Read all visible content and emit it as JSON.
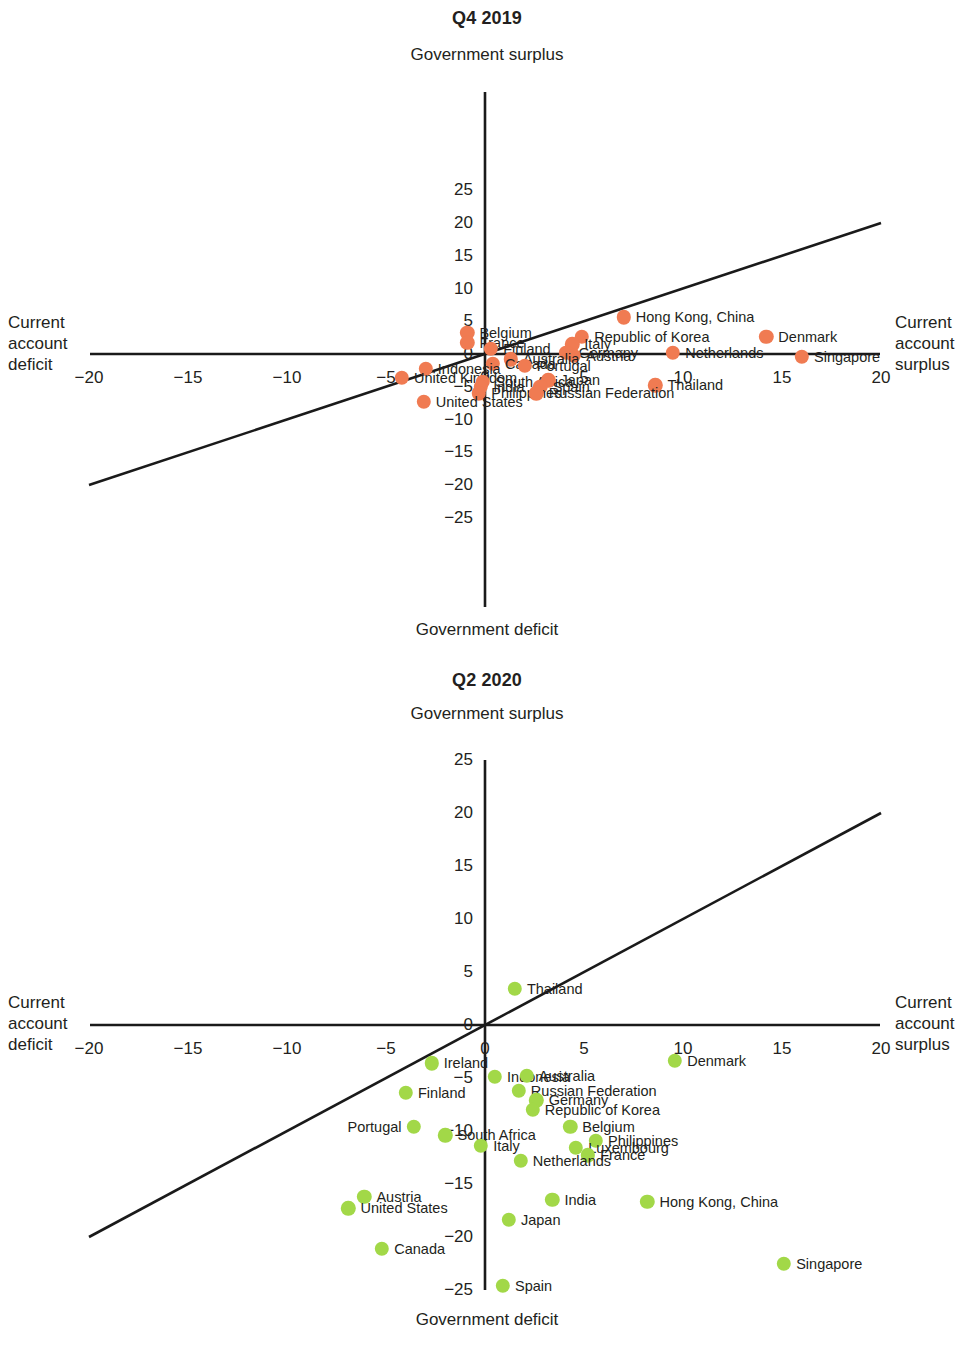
{
  "figure": {
    "axis_caption_top": "Government surplus",
    "axis_caption_bottom": "Government deficit",
    "left_caption_lines": [
      "Current",
      "account",
      "deficit"
    ],
    "right_caption_lines": [
      "Current",
      "account",
      "surplus"
    ],
    "colors": {
      "q4_2019_dot": "#F07B52",
      "q2_2020_dot": "#A2D848",
      "axis": "#1a1a1a",
      "text": "#231f20"
    },
    "x_ticks": [
      "-20",
      "-15",
      "-10",
      "-5",
      "0",
      "5",
      "10",
      "15",
      "20"
    ],
    "x_tick_values": [
      -20,
      -15,
      -10,
      -5,
      0,
      5,
      10,
      15,
      20
    ],
    "y_ticks": [
      "25",
      "20",
      "15",
      "10",
      "5",
      "0",
      "-5",
      "-10",
      "-15",
      "-20",
      "-25"
    ],
    "y_tick_values": [
      25,
      20,
      15,
      10,
      5,
      0,
      -5,
      -10,
      -15,
      -20,
      -25
    ]
  },
  "chart_data": [
    {
      "type": "scatter",
      "title": "Q4 2019",
      "xlabel": "Current account deficit / Current account surplus",
      "ylabel": "Government deficit / Government surplus",
      "xlim": [
        -20,
        20
      ],
      "ylim": [
        -25,
        25
      ],
      "grid": false,
      "legend": "none",
      "annotations": [
        "45-degree reference line y = x"
      ],
      "color": "#F07B52",
      "points": [
        {
          "label": "Hong Kong, China",
          "x": 7.0,
          "y": 5.6,
          "lab": "r"
        },
        {
          "label": "Belgium",
          "x": -0.9,
          "y": 3.2,
          "lab": "r"
        },
        {
          "label": "Republic of Korea",
          "x": 4.9,
          "y": 2.6,
          "lab": "r"
        },
        {
          "label": "Denmark",
          "x": 14.2,
          "y": 2.6,
          "lab": "r"
        },
        {
          "label": "France",
          "x": -0.9,
          "y": 1.7,
          "lab": "r"
        },
        {
          "label": "Italy",
          "x": 4.4,
          "y": 1.5,
          "lab": "r"
        },
        {
          "label": "Finland",
          "x": 0.3,
          "y": 0.8,
          "lab": "r"
        },
        {
          "label": "Germany",
          "x": 4.1,
          "y": 0.2,
          "lab": "r"
        },
        {
          "label": "Netherlands",
          "x": 9.5,
          "y": 0.2,
          "lab": "r"
        },
        {
          "label": "Austria",
          "x": 4.5,
          "y": -0.3,
          "lab": "r"
        },
        {
          "label": "Singapore",
          "x": 16.0,
          "y": -0.4,
          "lab": "r"
        },
        {
          "label": "Australia",
          "x": 1.3,
          "y": -0.8,
          "lab": "r"
        },
        {
          "label": "Canada",
          "x": 0.4,
          "y": -1.5,
          "lab": "r"
        },
        {
          "label": "Portugal",
          "x": 2.0,
          "y": -1.8,
          "lab": "r"
        },
        {
          "label": "Indonesia",
          "x": -3.0,
          "y": -2.3,
          "lab": "r"
        },
        {
          "label": "United Kingdom",
          "x": -4.2,
          "y": -3.6,
          "lab": "r"
        },
        {
          "label": "South Africa",
          "x": -0.1,
          "y": -4.2,
          "lab": "r"
        },
        {
          "label": "Japan",
          "x": 3.2,
          "y": -4.0,
          "lab": "r"
        },
        {
          "label": "India",
          "x": -0.2,
          "y": -5.0,
          "lab": "r"
        },
        {
          "label": "Spain",
          "x": 2.8,
          "y": -5.0,
          "lab": "r"
        },
        {
          "label": "Thailand",
          "x": 8.6,
          "y": -4.8,
          "lab": "r"
        },
        {
          "label": "Philippines",
          "x": -0.3,
          "y": -6.0,
          "lab": "r"
        },
        {
          "label": "Russian Federation",
          "x": 2.6,
          "y": -6.0,
          "lab": "r"
        },
        {
          "label": "United States",
          "x": -3.1,
          "y": -7.3,
          "lab": "r"
        }
      ]
    },
    {
      "type": "scatter",
      "title": "Q2 2020",
      "xlabel": "Current account deficit / Current account surplus",
      "ylabel": "Government deficit / Government surplus",
      "xlim": [
        -20,
        20
      ],
      "ylim": [
        -25,
        25
      ],
      "grid": false,
      "legend": "none",
      "annotations": [
        "45-degree reference line y = x"
      ],
      "color": "#A2D848",
      "points": [
        {
          "label": "Thailand",
          "x": 1.5,
          "y": 3.4,
          "lab": "r"
        },
        {
          "label": "Denmark",
          "x": 9.6,
          "y": -3.4,
          "lab": "r"
        },
        {
          "label": "Ireland",
          "x": -2.7,
          "y": -3.6,
          "lab": "r"
        },
        {
          "label": "Indonesia",
          "x": 0.5,
          "y": -4.9,
          "lab": "r"
        },
        {
          "label": "Australia",
          "x": 2.1,
          "y": -4.8,
          "lab": "r"
        },
        {
          "label": "Russian Federation",
          "x": 1.7,
          "y": -6.2,
          "lab": "r"
        },
        {
          "label": "Finland",
          "x": -4.0,
          "y": -6.4,
          "lab": "r"
        },
        {
          "label": "Germany",
          "x": 2.6,
          "y": -7.1,
          "lab": "r"
        },
        {
          "label": "Republic of Korea",
          "x": 2.4,
          "y": -8.0,
          "lab": "r"
        },
        {
          "label": "Portugal",
          "x": -3.6,
          "y": -9.6,
          "lab": "l"
        },
        {
          "label": "Belgium",
          "x": 4.3,
          "y": -9.6,
          "lab": "r"
        },
        {
          "label": "South Africa",
          "x": -2.0,
          "y": -10.4,
          "lab": "r"
        },
        {
          "label": "Philippines",
          "x": 5.6,
          "y": -10.9,
          "lab": "r"
        },
        {
          "label": "Italy",
          "x": -0.2,
          "y": -11.4,
          "lab": "r"
        },
        {
          "label": "Luxembourg",
          "x": 4.6,
          "y": -11.6,
          "lab": "r"
        },
        {
          "label": "France",
          "x": 5.2,
          "y": -12.3,
          "lab": "r"
        },
        {
          "label": "Netherlands",
          "x": 1.8,
          "y": -12.8,
          "lab": "r"
        },
        {
          "label": "Austria",
          "x": -6.1,
          "y": -16.2,
          "lab": "r"
        },
        {
          "label": "India",
          "x": 3.4,
          "y": -16.5,
          "lab": "r"
        },
        {
          "label": "Hong Kong, China",
          "x": 8.2,
          "y": -16.7,
          "lab": "r"
        },
        {
          "label": "United States",
          "x": -6.9,
          "y": -17.3,
          "lab": "r"
        },
        {
          "label": "Japan",
          "x": 1.2,
          "y": -18.4,
          "lab": "r"
        },
        {
          "label": "Canada",
          "x": -5.2,
          "y": -21.1,
          "lab": "r"
        },
        {
          "label": "Singapore",
          "x": 15.1,
          "y": -22.5,
          "lab": "r"
        },
        {
          "label": "Spain",
          "x": 0.9,
          "y": -24.6,
          "lab": "r"
        }
      ]
    }
  ]
}
